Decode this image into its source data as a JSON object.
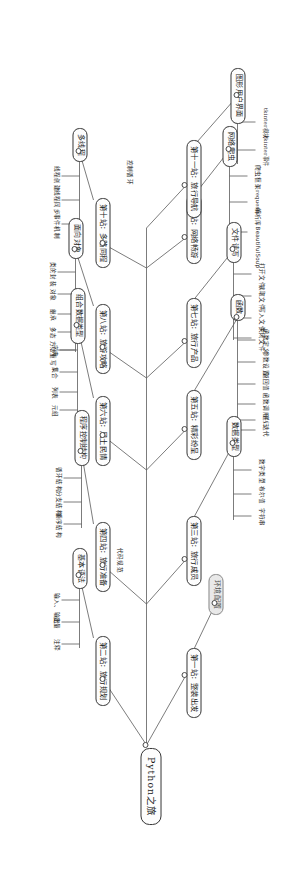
{
  "diagram": {
    "type": "mind-map",
    "title": "Python之旅",
    "orientation": "rotated-90-clockwise",
    "colors": {
      "node_border": "#3a3a3a",
      "link": "#5a5a5a",
      "background": "#ffffff",
      "muted_node": "#e9e9e9"
    },
    "root": {
      "label": "Python之旅"
    },
    "stations": [
      {
        "id": "s1",
        "label": "第一站：整装出发"
      },
      {
        "id": "s2",
        "label": "第二站：旅行规划"
      },
      {
        "id": "s3",
        "label": "第三站：旅行成员"
      },
      {
        "id": "s4",
        "label": "第四站：旅行准备"
      },
      {
        "id": "s5",
        "label": "第五站：精彩纷呈"
      },
      {
        "id": "s6",
        "label": "第六站：风土民情"
      },
      {
        "id": "s7",
        "label": "第七站：旅行产品"
      },
      {
        "id": "s8",
        "label": "第八站：旅游攻略"
      },
      {
        "id": "s9",
        "label": "第九站：网络畅游"
      },
      {
        "id": "s10",
        "label": "第十站：多路同程"
      },
      {
        "id": "s11",
        "label": "第十一站：旅行导航"
      }
    ],
    "topics": [
      {
        "id": "t_env",
        "label": "环境配置",
        "muted": true,
        "leaves": []
      },
      {
        "id": "t_base",
        "label": "基本语法",
        "muted": false,
        "leaves": [
          "输入、输出",
          "变量",
          "注释"
        ]
      },
      {
        "id": "t_dtype",
        "label": "数据类型",
        "muted": false,
        "leaves": [
          "数字类型",
          "布尔值",
          "字符串"
        ]
      },
      {
        "id": "t_ctrl",
        "label": "程序控制结构",
        "muted": false,
        "leaves": [
          "循环结构",
          "分支结构",
          "顺序结构"
        ]
      },
      {
        "id": "t_func",
        "label": "函数",
        "muted": false,
        "leaves": [
          "函数定义",
          "参数设置",
          "返回值",
          "函数调用",
          "递归",
          "迭代"
        ]
      },
      {
        "id": "t_coll",
        "label": "组合数据类型",
        "muted": false,
        "leaves": [
          "字典",
          "集合",
          "列表",
          "元组"
        ]
      },
      {
        "id": "t_file",
        "label": "文件读写",
        "muted": false,
        "leaves": [
          "打开文件",
          "读取文件",
          "写入文件",
          "关闭文件"
        ]
      },
      {
        "id": "t_oop",
        "label": "面向对象",
        "muted": false,
        "leaves": [
          "类的封装",
          "对象",
          "继承",
          "多态",
          "方法重写"
        ]
      },
      {
        "id": "t_spider",
        "label": "网络爬虫",
        "muted": false,
        "leaves": [
          "爬虫框架",
          "requests",
          "解析库BeautifulSoup"
        ]
      },
      {
        "id": "t_thread",
        "label": "多线程",
        "muted": false,
        "leaves": [
          "线程创建",
          "线程同步",
          "事件机制"
        ]
      },
      {
        "id": "t_gui",
        "label": "图形用户界面",
        "muted": false,
        "leaves": [
          "tkinter模块",
          "tkinter事件"
        ]
      }
    ],
    "edges": [
      {
        "from": "root",
        "to": "s1"
      },
      {
        "from": "root",
        "to": "s2"
      },
      {
        "from": "root",
        "to": "s3"
      },
      {
        "from": "root",
        "to": "s4"
      },
      {
        "from": "root",
        "to": "s5"
      },
      {
        "from": "root",
        "to": "s6"
      },
      {
        "from": "root",
        "to": "s7"
      },
      {
        "from": "root",
        "to": "s8"
      },
      {
        "from": "root",
        "to": "s9"
      },
      {
        "from": "root",
        "to": "s10"
      },
      {
        "from": "root",
        "to": "s11"
      },
      {
        "from": "s1",
        "to": "t_env"
      },
      {
        "from": "s2",
        "to": "t_base"
      },
      {
        "from": "s3",
        "to": "t_dtype"
      },
      {
        "from": "s4",
        "to": "t_ctrl"
      },
      {
        "from": "s5",
        "to": "t_func"
      },
      {
        "from": "s6",
        "to": "t_coll"
      },
      {
        "from": "s7",
        "to": "t_file"
      },
      {
        "from": "s8",
        "to": "t_oop"
      },
      {
        "from": "s9",
        "to": "t_spider"
      },
      {
        "from": "s10",
        "to": "t_thread"
      },
      {
        "from": "s11",
        "to": "t_gui"
      }
    ],
    "edge_labels": [
      {
        "id": "el_code",
        "text": "代码规范"
      },
      {
        "id": "el_ctrl",
        "text": "控制循环"
      }
    ]
  }
}
